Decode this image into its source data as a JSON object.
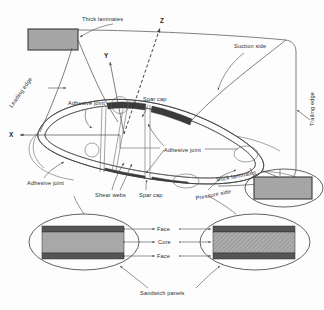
{
  "figure": {
    "type": "engineering-cross-section-diagram"
  },
  "axes": {
    "x_label": "X",
    "y_label": "Y",
    "z_label": "Z"
  },
  "labels": {
    "thick_laminates_top": "Thick laminates",
    "suction_side": "Suction side",
    "trailing_edge": "Trailing edge",
    "leading_edge": "Leading edge",
    "adhesive_joint_upper_left": "Adhesive joint",
    "adhesive_joint_lower_left": "Adhesive joint",
    "adhesive_joint_right": "Adhesive joint",
    "spar_cap_top": "Spar cap",
    "spar_cap_bottom": "Spar cap",
    "shear_webs": "Shear webs",
    "thick_laminates_right": "Thick laminates",
    "pressure_side": "Pressure side",
    "face_top": "Face",
    "core": "Core",
    "face_bottom": "Face",
    "sandwich_panels": "Sandwich panels"
  },
  "colors": {
    "shell_fill": "#b3b3b3",
    "spar_cap_fill": "#3b3b3b",
    "core_fill": "#a8a8a8",
    "face_fill": "#555555",
    "hatched_core_fill": "#a0a0a0",
    "detail_box_fill": "#a6a6a6",
    "line": "#4a4a4a",
    "text": "#2b2b2b",
    "background": "#fdfdfd"
  },
  "callouts": {
    "top_left_detail_box": "thick-laminate-detail-leading-edge",
    "right_detail_box": "thick-laminate-detail-trailing-edge",
    "left_sandwich_detail": "sandwich-panel-detail-solid-core",
    "right_sandwich_detail": "sandwich-panel-detail-hatched-core"
  }
}
